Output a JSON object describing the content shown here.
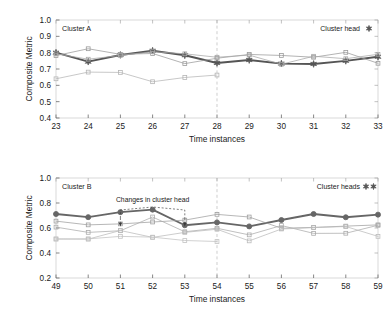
{
  "figure": {
    "panels": [
      {
        "id": "cluster-a",
        "panel_label": "Cluster A",
        "legend_label": "Cluster head",
        "legend_markers": 1
      },
      {
        "id": "cluster-b",
        "panel_label": "Cluster B",
        "legend_label": "Cluster heads",
        "legend_markers": 2,
        "annotation": "Changes in cluster head"
      }
    ]
  },
  "chart_data": [
    {
      "type": "line",
      "id": "cluster-a",
      "title": "Cluster A",
      "xlabel": "Time instances",
      "ylabel": "Composite Metric",
      "x": [
        23,
        24,
        25,
        26,
        27,
        28,
        29,
        30,
        31,
        32,
        33
      ],
      "xlim": [
        23,
        33
      ],
      "ylim": [
        0.4,
        1.0
      ],
      "ytick_labels": [
        "0.4",
        "0.5",
        "0.6",
        "0.7",
        "0.8",
        "0.9",
        "1.0"
      ],
      "yticks": [
        0.4,
        0.5,
        0.6,
        0.7,
        0.8,
        0.9,
        1.0
      ],
      "xtick_labels": [
        "23",
        "24",
        "25",
        "26",
        "27",
        "28",
        "29",
        "30",
        "31",
        "32",
        "33"
      ],
      "grid": false,
      "legend_position": "top-right",
      "vline_x": 28,
      "series": [
        {
          "name": "cluster-head",
          "marker": "star",
          "emphasis": true,
          "color": "#555555",
          "values": [
            0.8,
            0.745,
            0.786,
            0.812,
            0.784,
            0.737,
            0.755,
            0.733,
            0.731,
            0.75,
            0.775
          ]
        },
        {
          "name": "member-1",
          "marker": "square",
          "emphasis": false,
          "color": "#9a9a9a",
          "values": [
            0.782,
            0.824,
            0.79,
            0.795,
            0.733,
            0.766,
            0.789,
            0.783,
            0.772,
            0.802,
            0.735
          ]
        },
        {
          "name": "member-2",
          "marker": "square",
          "emphasis": false,
          "color": "#a8a8a8",
          "values": [
            0.793,
            0.76,
            0.783,
            0.806,
            0.793,
            0.772,
            0.785,
            0.729,
            0.778,
            0.763,
            0.79
          ]
        },
        {
          "name": "member-3",
          "marker": "square",
          "emphasis": false,
          "color": "#b5b5b5",
          "values": [
            0.64,
            0.681,
            0.679,
            0.622,
            0.648,
            0.663,
            null,
            null,
            null,
            null,
            null
          ]
        }
      ]
    },
    {
      "type": "line",
      "id": "cluster-b",
      "title": "Cluster B",
      "xlabel": "Time instances",
      "ylabel": "Composite Metric",
      "x": [
        49,
        50,
        51,
        52,
        53,
        54,
        55,
        56,
        57,
        58,
        59
      ],
      "xlim": [
        49,
        59
      ],
      "ylim": [
        0.2,
        1.0
      ],
      "ytick_labels": [
        "0.2",
        "0.4",
        "0.6",
        "0.8",
        "1.0"
      ],
      "yticks": [
        0.2,
        0.4,
        0.6,
        0.8,
        1.0
      ],
      "xtick_labels": [
        "49",
        "50",
        "51",
        "52",
        "53",
        "54",
        "55",
        "56",
        "57",
        "58",
        "59"
      ],
      "grid": false,
      "legend_position": "top-right",
      "vline_x": 54,
      "annotation_text": "Changes in cluster head",
      "annotation_arrow_x": [
        51,
        53
      ],
      "series": [
        {
          "name": "cluster-head",
          "marker": "circle",
          "emphasis": true,
          "color": "#666666",
          "values": [
            0.712,
            0.687,
            0.727,
            0.747,
            0.622,
            0.645,
            0.613,
            0.664,
            0.712,
            0.686,
            0.707
          ]
        },
        {
          "name": "member-1",
          "marker": "square",
          "emphasis": false,
          "color": "#9f9f9f",
          "values": [
            0.655,
            0.625,
            0.633,
            0.648,
            0.663,
            0.709,
            0.688,
            0.598,
            0.605,
            0.615,
            0.625
          ]
        },
        {
          "name": "member-2",
          "marker": "square",
          "emphasis": false,
          "color": "#ababab",
          "values": [
            0.607,
            0.565,
            0.578,
            0.688,
            0.57,
            0.598,
            0.545,
            0.62,
            0.557,
            0.558,
            0.622
          ]
        },
        {
          "name": "member-3",
          "marker": "square",
          "emphasis": false,
          "color": "#bbbbbb",
          "values": [
            0.512,
            0.511,
            0.58,
            0.525,
            0.565,
            0.59,
            0.497,
            0.592,
            0.603,
            0.612,
            0.533
          ]
        },
        {
          "name": "member-4",
          "marker": "square",
          "emphasis": false,
          "color": "#c2c2c2",
          "values": [
            0.512,
            0.513,
            0.533,
            0.527,
            0.5,
            0.492,
            null,
            null,
            null,
            null,
            null
          ]
        }
      ]
    }
  ]
}
